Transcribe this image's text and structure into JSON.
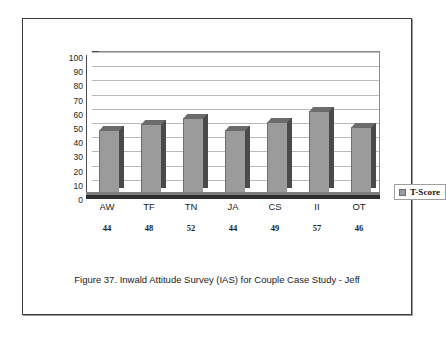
{
  "figure": {
    "caption": "Figure 37. Inwald Attitude Survey (IAS) for Couple Case Study - Jeff"
  },
  "legend": {
    "label": "T-Score",
    "swatch_color": "#9b9b9b",
    "position": "right"
  },
  "colors": {
    "bar_front": "#9b9b9b",
    "bar_side": "#4a4a4a",
    "bar_top": "#6b6b6b",
    "gridline": "#b9b9b9",
    "axis": "#4c4c4c",
    "page_border": "#3b3b3b",
    "text": "#1d1d1d",
    "background": "#ffffff"
  },
  "chart_data": {
    "type": "bar",
    "title": "",
    "subtitle": "",
    "xlabel": "",
    "ylabel": "",
    "categories": [
      "AW",
      "TF",
      "TN",
      "JA",
      "CS",
      "II",
      "OT"
    ],
    "values": [
      44,
      48,
      52,
      44,
      49,
      57,
      46
    ],
    "series": [
      {
        "name": "T-Score",
        "values": [
          44,
          48,
          52,
          44,
          49,
          57,
          46
        ]
      }
    ],
    "data_labels": [
      "44",
      "48",
      "52",
      "44",
      "49",
      "57",
      "46"
    ],
    "ylim": [
      0,
      100
    ],
    "ytick_labels": [
      "100",
      "90",
      "80",
      "70",
      "60",
      "50",
      "40",
      "30",
      "20",
      "10",
      "0"
    ],
    "ytick_values": [
      100,
      90,
      80,
      70,
      60,
      50,
      40,
      30,
      20,
      10,
      0
    ],
    "grid": true,
    "grid_axis": "y",
    "legend": "T-Score",
    "legend_position": "right",
    "style": "3d-column"
  }
}
